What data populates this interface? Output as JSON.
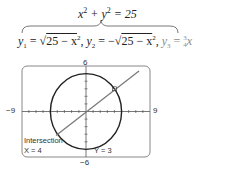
{
  "equations": {
    "circle": "x² + y² = 25",
    "y1_label": "y",
    "y1_sub": "1",
    "y1_expr": "25 − x",
    "y2_label": "y",
    "y2_sub": "2",
    "y2_expr": "25 − x",
    "y3_label": "y",
    "y3_sub": "3",
    "y3_frac_num": "3",
    "y3_frac_den": "4"
  },
  "graph": {
    "ymax_label": "6",
    "ymin_label": "−6",
    "xmin_label": "−9",
    "xmax_label": "9",
    "window": {
      "xmin": -9,
      "xmax": 9,
      "ymin": -6,
      "ymax": 6
    },
    "screen_title": "Intersection",
    "x_readout": "X = 4",
    "y_readout": "Y = 3",
    "intersection_point": {
      "x": 4,
      "y": 3
    },
    "circle_radius": 5,
    "line_slope": 0.75,
    "colors": {
      "circle": "#222222",
      "line": "#777777",
      "frame": "#888888",
      "axis": "#555555"
    }
  }
}
